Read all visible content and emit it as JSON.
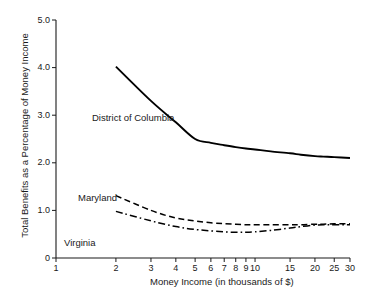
{
  "chart_data": {
    "type": "line",
    "title": "",
    "xlabel": "Money Income (in thousands of $)",
    "ylabel": "Total Benefits as a Percentage of Money Income",
    "xscale": "log",
    "xlim": [
      1,
      30
    ],
    "ylim": [
      0,
      5.0
    ],
    "grid": false,
    "legend": "inline-annotations",
    "xticks": [
      1,
      2,
      3,
      4,
      5,
      6,
      7,
      8,
      9,
      10,
      15,
      20,
      25,
      30
    ],
    "xtick_labels": [
      "1",
      "2",
      "3",
      "4",
      "5",
      "6",
      "7",
      "8",
      "9",
      "10",
      "15",
      "20",
      "25",
      "30"
    ],
    "yticks": [
      0,
      1.0,
      2.0,
      3.0,
      4.0,
      5.0
    ],
    "ytick_labels": [
      "0",
      "1.0",
      "2.0",
      "3.0",
      "4.0",
      "5.0"
    ],
    "series": [
      {
        "name": "District of Columbia",
        "style": "solid",
        "color": "#000000",
        "x": [
          2,
          3,
          4,
          5,
          6,
          7,
          8,
          9,
          10,
          12,
          15,
          17,
          20,
          22,
          25,
          30
        ],
        "values": [
          4.02,
          3.3,
          2.85,
          2.5,
          2.42,
          2.37,
          2.33,
          2.3,
          2.28,
          2.24,
          2.2,
          2.17,
          2.14,
          2.13,
          2.12,
          2.1
        ]
      },
      {
        "name": "Maryland",
        "style": "dashed",
        "color": "#000000",
        "x": [
          2,
          3,
          4,
          5,
          6,
          7,
          8,
          9,
          10,
          12,
          15,
          17,
          20,
          22,
          25,
          30
        ],
        "values": [
          1.31,
          1.0,
          0.84,
          0.78,
          0.74,
          0.72,
          0.71,
          0.7,
          0.7,
          0.7,
          0.7,
          0.7,
          0.71,
          0.71,
          0.72,
          0.72
        ]
      },
      {
        "name": "Virginia",
        "style": "dashdot",
        "color": "#000000",
        "x": [
          2,
          3,
          4,
          5,
          6,
          7,
          8,
          9,
          10,
          12,
          15,
          17,
          20,
          22,
          25,
          30
        ],
        "values": [
          0.98,
          0.78,
          0.66,
          0.6,
          0.57,
          0.55,
          0.54,
          0.54,
          0.55,
          0.58,
          0.63,
          0.66,
          0.69,
          0.7,
          0.7,
          0.7
        ]
      }
    ],
    "annotations": [
      {
        "text": "District of Columbia",
        "x_px": 92,
        "y_px": 113
      },
      {
        "text": "Maryland",
        "x_px": 78,
        "y_px": 193
      },
      {
        "text": "Virginia",
        "x_px": 64,
        "y_px": 238
      }
    ]
  }
}
